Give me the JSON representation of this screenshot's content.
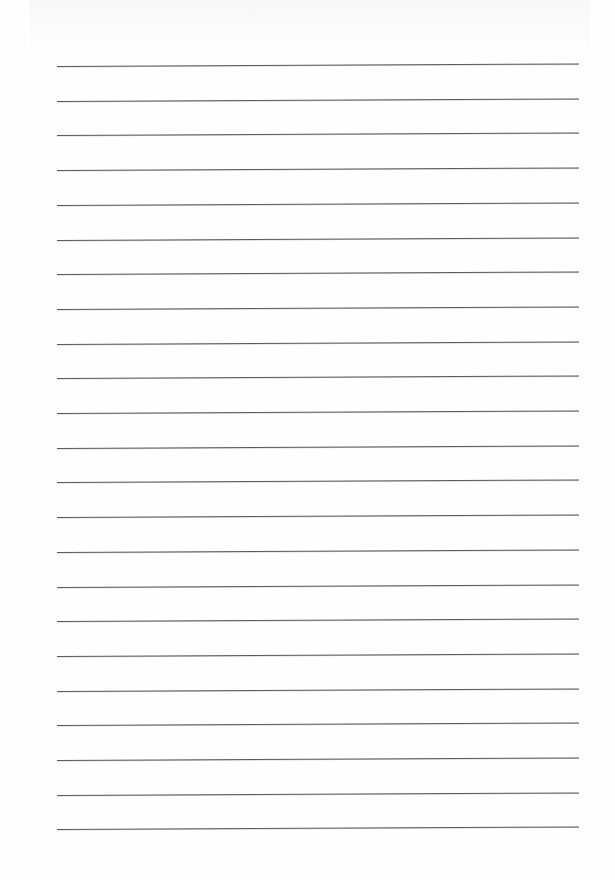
{
  "page": {
    "type": "blank lined paper",
    "background_color": "#fefefe",
    "line_color": "#5a5a5a",
    "line_count": 23,
    "line_left_px": 57,
    "line_right_px": 579,
    "first_line_y_px": 66,
    "line_spacing_px": 34.7,
    "text_content": ""
  }
}
